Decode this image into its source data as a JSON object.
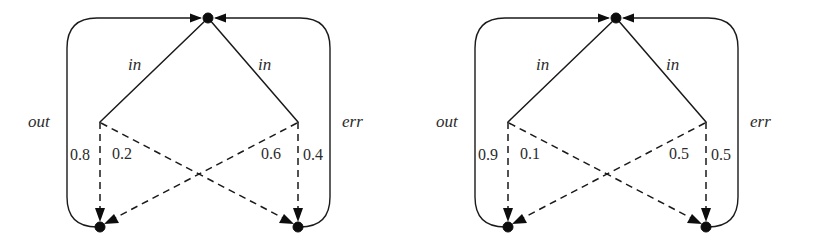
{
  "figure": {
    "type": "graph-pair",
    "background_color": "#ffffff",
    "ink_color": "#1a1a1a"
  },
  "diagrams": [
    {
      "id": "left",
      "name": "left-graph",
      "nodes": [
        {
          "id": "top",
          "name": "top-node",
          "cx": 208,
          "cy": 18
        },
        {
          "id": "mid-left",
          "name": "mid-left-junction",
          "cx": 100,
          "cy": 122
        },
        {
          "id": "mid-right",
          "name": "mid-right-junction",
          "cx": 298,
          "cy": 122
        },
        {
          "id": "bottom-left",
          "name": "bottom-left-node",
          "cx": 100,
          "cy": 227
        },
        {
          "id": "bottom-right",
          "name": "bottom-right-node",
          "cx": 298,
          "cy": 227
        }
      ],
      "edge_labels": {
        "in_left": "in",
        "in_right": "in",
        "out": "out",
        "err": "err"
      },
      "weights": {
        "left_outer": "0.8",
        "left_inner": "0.2",
        "right_inner": "0.6",
        "right_outer": "0.4"
      }
    },
    {
      "id": "right",
      "name": "right-graph",
      "nodes": [
        {
          "id": "top",
          "name": "top-node",
          "cx": 208,
          "cy": 18
        },
        {
          "id": "mid-left",
          "name": "mid-left-junction",
          "cx": 100,
          "cy": 122
        },
        {
          "id": "mid-right",
          "name": "mid-right-junction",
          "cx": 298,
          "cy": 122
        },
        {
          "id": "bottom-left",
          "name": "bottom-left-node",
          "cx": 100,
          "cy": 227
        },
        {
          "id": "bottom-right",
          "name": "bottom-right-node",
          "cx": 298,
          "cy": 227
        }
      ],
      "edge_labels": {
        "in_left": "in",
        "in_right": "in",
        "out": "out",
        "err": "err"
      },
      "weights": {
        "left_outer": "0.9",
        "left_inner": "0.1",
        "right_inner": "0.5",
        "right_outer": "0.5"
      }
    }
  ]
}
